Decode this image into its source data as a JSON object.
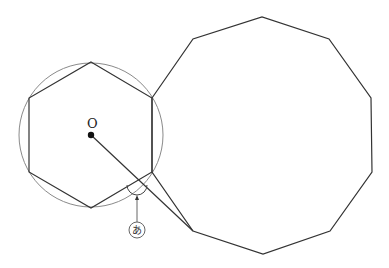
{
  "diagram": {
    "labels": {
      "center": "O",
      "angle_marker": "あ"
    },
    "colors": {
      "stroke": "#333333",
      "circle": "#888888",
      "background": "#ffffff"
    },
    "circle": {
      "cx": 91,
      "cy": 135,
      "r": 72
    },
    "center_point": {
      "x": 91,
      "y": 135
    },
    "hexagon": [
      [
        91,
        62
      ],
      [
        152,
        98
      ],
      [
        152,
        172
      ],
      [
        91,
        208
      ],
      [
        29,
        172
      ],
      [
        29,
        98
      ]
    ],
    "decagon": [
      [
        152,
        98
      ],
      [
        193,
        39
      ],
      [
        262,
        17
      ],
      [
        329,
        39
      ],
      [
        371,
        98
      ],
      [
        372,
        172
      ],
      [
        330,
        231
      ],
      [
        263,
        254
      ],
      [
        193,
        231
      ],
      [
        152,
        172
      ]
    ],
    "segment_from_center": [
      [
        91,
        135
      ],
      [
        193,
        231
      ]
    ],
    "angle_arc": {
      "cx": 137,
      "cy": 184,
      "r": 10
    },
    "pointer": {
      "from": [
        137,
        221
      ],
      "to": [
        137,
        196
      ]
    },
    "marker_circle": {
      "cx": 137,
      "cy": 230,
      "r": 8
    }
  }
}
